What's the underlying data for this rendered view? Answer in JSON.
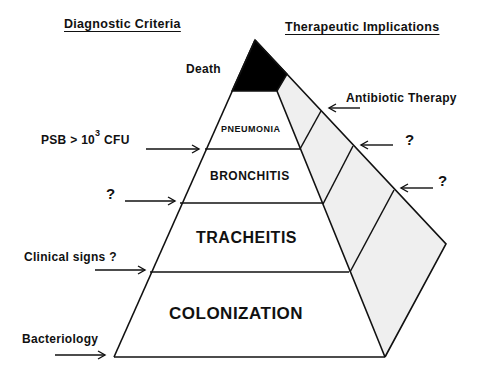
{
  "headers": {
    "left": "Diagnostic Criteria",
    "right": "Therapeutic Implications"
  },
  "pyramid_levels": [
    {
      "id": "death",
      "label": "Death",
      "fill": "#000000"
    },
    {
      "id": "pneumonia",
      "label": "PNEUMONIA"
    },
    {
      "id": "bronchitis",
      "label": "BRONCHITIS"
    },
    {
      "id": "tracheitis",
      "label": "TRACHEITIS"
    },
    {
      "id": "colonization",
      "label": "COLONIZATION"
    }
  ],
  "diagnostic_criteria": [
    {
      "text_main": "PSB > 10",
      "superscript": "3",
      "text_after": " CFU",
      "points_to": "pneumonia/bronchitis boundary"
    },
    {
      "text": "?",
      "points_to": "bronchitis/tracheitis boundary"
    },
    {
      "text": "Clinical signs ?",
      "points_to": "tracheitis/colonization boundary"
    },
    {
      "text": "Bacteriology",
      "points_to": "base of colonization"
    }
  ],
  "therapeutic_implications": [
    {
      "text": "Antibiotic Therapy"
    },
    {
      "text": "?"
    },
    {
      "text": "?"
    }
  ],
  "colors": {
    "line": "#111111",
    "side_fill": "#efefef",
    "death_fill": "#000000"
  }
}
